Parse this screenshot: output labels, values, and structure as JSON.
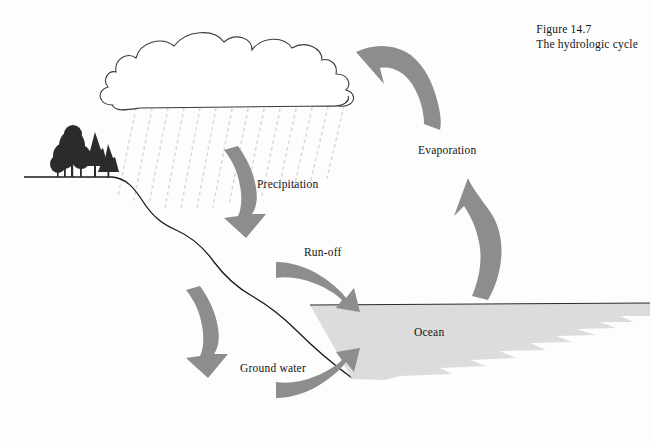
{
  "figure": {
    "caption_line1": "Figure 14.7",
    "caption_line2": "The hydrologic cycle",
    "background_color": "#fdfdfd"
  },
  "labels": {
    "precipitation": "Precipitation",
    "runoff": "Run-off",
    "ground_water": "Ground water",
    "evaporation": "Evaporation",
    "ocean": "Ocean"
  },
  "colors": {
    "arrow_gray": "#8d8d8d",
    "ocean_fill": "#dcdcdc",
    "line_black": "#1a1a1a",
    "rain_gray": "#d8d8d8",
    "tree_dark": "#2a2a2a"
  },
  "diagram": {
    "type": "schematic",
    "title": "The hydrologic cycle",
    "elements": [
      "cloud",
      "rain",
      "trees",
      "terrain",
      "ocean",
      "precipitation-arrow",
      "runoff-arrow",
      "ground-water-arrow",
      "ground-water-return-arrow",
      "evaporation-arrow-lower",
      "evaporation-arrow-upper"
    ],
    "flow_sequence": [
      "Evaporation",
      "Precipitation",
      "Run-off",
      "Ground water",
      "Ocean"
    ]
  }
}
